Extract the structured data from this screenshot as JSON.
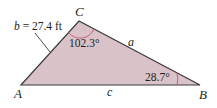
{
  "diagram": {
    "type": "triangle",
    "vertices": {
      "A": {
        "label": "A"
      },
      "B": {
        "label": "B"
      },
      "C": {
        "label": "C"
      }
    },
    "sides": {
      "a": {
        "label": "a"
      },
      "b": {
        "label": "b = 27.4 ft",
        "length": "27.4 ft"
      },
      "c": {
        "label": "c"
      }
    },
    "angles": {
      "C": {
        "label": "102.3°",
        "value": 102.3
      },
      "B": {
        "label": "28.7°",
        "value": 28.7
      }
    },
    "colors": {
      "fill": "#d9c3c8",
      "edge": "#3a3a3a",
      "arc": "#c9566e",
      "text": "#231f20"
    }
  }
}
